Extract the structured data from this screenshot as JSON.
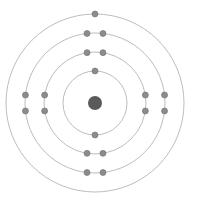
{
  "diagram": {
    "type": "bohr-atom-model",
    "center": [
      95,
      103
    ],
    "colors": {
      "background": "#ffffff",
      "ring": "#bdbdbd",
      "electron": "#8c8c8c",
      "electron_stroke": "#6e6e6e",
      "nucleus": "#5a5a5a"
    },
    "nucleus": {
      "radius": 7
    },
    "shells": [
      {
        "name": "shell-1",
        "radius": 32,
        "electrons": 2
      },
      {
        "name": "shell-2",
        "radius": 51,
        "electrons": 8
      },
      {
        "name": "shell-3",
        "radius": 70,
        "electrons": 8
      },
      {
        "name": "shell-4",
        "radius": 89,
        "electrons": 1
      }
    ],
    "electron_radius": 3,
    "total_electrons": 19
  }
}
